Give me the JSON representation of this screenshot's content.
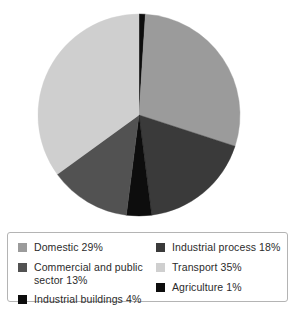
{
  "chart_data": {
    "type": "pie",
    "title": "",
    "subtitle": "",
    "xlabel": "",
    "ylabel": "",
    "grid": false,
    "legend_position": "bottom",
    "start_angle_deg": 0,
    "direction": "clockwise",
    "units": "percent",
    "total": 100,
    "categories": [
      "Agriculture",
      "Domestic",
      "Industrial process",
      "Industrial buildings",
      "Commercial and public sector",
      "Transport"
    ],
    "values": [
      1,
      29,
      18,
      4,
      13,
      35
    ],
    "slices": [
      {
        "label": "Agriculture",
        "value": 1,
        "color": "#0d0d0d"
      },
      {
        "label": "Domestic",
        "value": 29,
        "color": "#9b9b9b"
      },
      {
        "label": "Industrial process",
        "value": 18,
        "color": "#3a3a3a"
      },
      {
        "label": "Industrial buildings",
        "value": 4,
        "color": "#0d0d0d"
      },
      {
        "label": "Commercial and public sector",
        "value": 13,
        "color": "#525252"
      },
      {
        "label": "Transport",
        "value": 35,
        "color": "#cfcfcf"
      }
    ]
  },
  "legend": {
    "columns": [
      {
        "entries": [
          {
            "label": "Domestic 29%",
            "color": "#9b9b9b"
          },
          {
            "label": "Commercial and public\nsector 13%",
            "color": "#525252"
          },
          {
            "label": "Industrial buildings 4%",
            "color": "#0d0d0d"
          }
        ]
      },
      {
        "entries": [
          {
            "label": "Industrial process 18%",
            "color": "#3a3a3a"
          },
          {
            "label": "Transport 35%",
            "color": "#cfcfcf"
          },
          {
            "label": "Agriculture 1%",
            "color": "#0d0d0d"
          }
        ]
      }
    ]
  }
}
